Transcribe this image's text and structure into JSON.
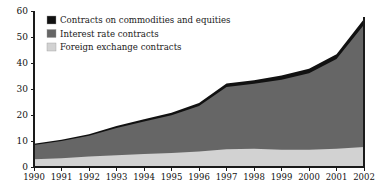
{
  "chart_data": {
    "type": "area",
    "stacked": true,
    "title": "",
    "subtitle": "",
    "xlabel": "",
    "ylabel": "",
    "categories": [
      "1990",
      "1991",
      "1992",
      "1993",
      "1994",
      "1995",
      "1996",
      "1997",
      "1998",
      "1999",
      "2000",
      "2001",
      "2002"
    ],
    "x": [
      1990,
      1991,
      1992,
      1993,
      1994,
      1995,
      1996,
      1997,
      1998,
      1999,
      2000,
      2001,
      2002
    ],
    "xlim": [
      1990,
      2002
    ],
    "ylim": [
      0,
      60
    ],
    "yticks": [
      0,
      10,
      20,
      30,
      40,
      50,
      60
    ],
    "ytick_labels": [
      "0",
      "10",
      "20",
      "30",
      "40",
      "50",
      "60"
    ],
    "xtick_labels": [
      "1990",
      "1991",
      "1992",
      "1993",
      "1994",
      "1995",
      "1996",
      "1997",
      "1998",
      "1999",
      "2000",
      "2001",
      "2002"
    ],
    "grid": false,
    "legend_position": "top-left-inside",
    "series": [
      {
        "name": "Foreign exchange contracts",
        "color": "#d2d2d2",
        "values": [
          3.0,
          3.4,
          4.0,
          4.5,
          5.0,
          5.4,
          6.0,
          6.8,
          7.0,
          6.6,
          6.6,
          7.0,
          7.7
        ]
      },
      {
        "name": "Interest rate contracts",
        "color": "#666666",
        "values": [
          5.5,
          6.6,
          8.0,
          10.5,
          12.5,
          14.5,
          17.5,
          24.0,
          25.0,
          27.0,
          29.5,
          34.5,
          47.0
        ]
      },
      {
        "name": "Contracts on commodities and equities",
        "color": "#111111",
        "values": [
          0.4,
          0.5,
          0.6,
          0.8,
          0.9,
          1.0,
          1.1,
          1.3,
          1.4,
          1.6,
          1.7,
          1.9,
          2.2
        ]
      }
    ],
    "totals": [
      8.9,
      10.5,
      12.6,
      15.8,
      18.4,
      20.9,
      24.6,
      32.1,
      33.4,
      35.2,
      37.8,
      43.4,
      56.9
    ]
  },
  "legend": {
    "entries": [
      {
        "label": "Contracts on commodities and equities",
        "swatch": "#111111"
      },
      {
        "label": "Interest rate contracts",
        "swatch": "#666666"
      },
      {
        "label": "Foreign exchange contracts",
        "swatch": "#d2d2d2"
      }
    ]
  },
  "colors": {
    "commodities_equities": "#111111",
    "interest_rate": "#666666",
    "foreign_exchange": "#d2d2d2",
    "axis": "#1a1a1a",
    "background": "#ffffff"
  }
}
